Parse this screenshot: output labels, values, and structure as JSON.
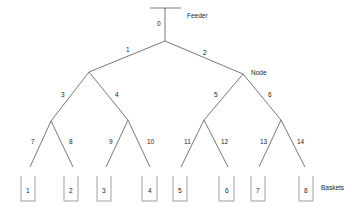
{
  "diagram": {
    "labels": {
      "feeder": "Feeder",
      "node": "Node",
      "baskets": "Baskets"
    },
    "feeder_edge": {
      "id": "0",
      "label": "0"
    },
    "edges": [
      {
        "id": "1",
        "label": "1",
        "from": "root",
        "to": "L"
      },
      {
        "id": "2",
        "label": "2",
        "from": "root",
        "to": "R"
      },
      {
        "id": "3",
        "label": "3",
        "from": "L",
        "to": "LL"
      },
      {
        "id": "4",
        "label": "4",
        "from": "L",
        "to": "LR"
      },
      {
        "id": "5",
        "label": "5",
        "from": "R",
        "to": "RL"
      },
      {
        "id": "6",
        "label": "6",
        "from": "R",
        "to": "RR"
      },
      {
        "id": "7",
        "label": "7",
        "from": "LL",
        "to": "B1"
      },
      {
        "id": "8",
        "label": "8",
        "from": "LL",
        "to": "B2"
      },
      {
        "id": "9",
        "label": "9",
        "from": "LR",
        "to": "B3"
      },
      {
        "id": "10",
        "label": "10",
        "from": "LR",
        "to": "B4"
      },
      {
        "id": "11",
        "label": "11",
        "from": "RL",
        "to": "B5"
      },
      {
        "id": "12",
        "label": "12",
        "from": "RL",
        "to": "B6"
      },
      {
        "id": "13",
        "label": "13",
        "from": "RR",
        "to": "B7"
      },
      {
        "id": "14",
        "label": "14",
        "from": "RR",
        "to": "B8"
      }
    ],
    "baskets": [
      {
        "id": "B1",
        "label": "1"
      },
      {
        "id": "B2",
        "label": "2"
      },
      {
        "id": "B3",
        "label": "3"
      },
      {
        "id": "B4",
        "label": "4"
      },
      {
        "id": "B5",
        "label": "5"
      },
      {
        "id": "B6",
        "label": "6"
      },
      {
        "id": "B7",
        "label": "7"
      },
      {
        "id": "B8",
        "label": "8"
      }
    ]
  }
}
